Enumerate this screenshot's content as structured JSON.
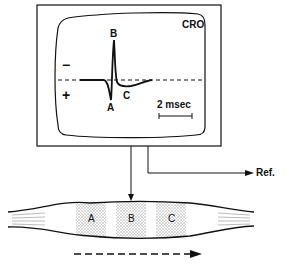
{
  "diagram": {
    "oscilloscope": {
      "label": "CRO",
      "polarity_negative": "−",
      "polarity_positive": "+",
      "waveform_points": {
        "A": "A",
        "B": "B",
        "C": "C"
      },
      "scale_label": "2 msec"
    },
    "reference": {
      "label": "Ref."
    },
    "muscle": {
      "regions": [
        "A",
        "B",
        "C"
      ]
    },
    "colors": {
      "ink": "#111111",
      "stipple": "#bdbdbd",
      "background": "#ffffff"
    }
  }
}
